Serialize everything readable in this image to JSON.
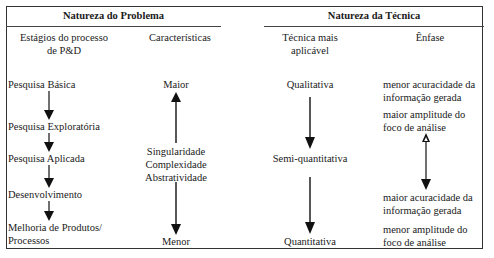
{
  "table": {
    "group_headers": {
      "problem": "Natureza do Problema",
      "technique": "Natureza da Técnica"
    },
    "column_headers": {
      "stages_line1": "Estágios do processo",
      "stages_line2": "de P&D",
      "characteristics": "Características",
      "technique_line1": "Técnica mais",
      "technique_line2": "aplicável",
      "emphasis": "Ênfase"
    },
    "stages": [
      "Pesquisa Básica",
      "Pesquisa Exploratória",
      "Pesquisa Aplicada",
      "Desenvolvimento",
      "Melhoria de Produtos/",
      "Processos"
    ],
    "characteristics": {
      "top": "Maior",
      "middle": [
        "Singularidade",
        "Complexidade",
        "Abstratividade"
      ],
      "bottom": "Menor"
    },
    "techniques": {
      "top": "Qualitativa",
      "middle": "Semi-quantitativa",
      "bottom": "Quantitativa"
    },
    "emphasis": {
      "block1": [
        "menor acuracidade da",
        "informação gerada"
      ],
      "block2": [
        "maior amplitude do",
        "foco de análise"
      ],
      "block3": [
        "maior acuracidade da",
        "informação gerada"
      ],
      "block4": [
        "menor amplitude do",
        "foco de análise"
      ]
    },
    "arrow_color": "#111111"
  }
}
